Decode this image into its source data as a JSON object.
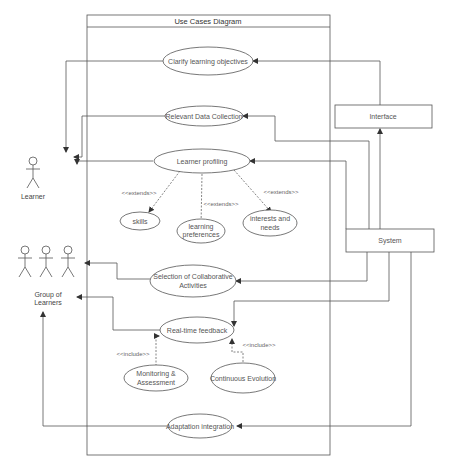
{
  "diagram": {
    "title": "Use Cases Diagram",
    "actors": {
      "learner": {
        "label": "Learner"
      },
      "group": {
        "label_line1": "Group of",
        "label_line2": "Learners"
      }
    },
    "external": {
      "interface": {
        "label": "Interface"
      },
      "system": {
        "label": "System"
      }
    },
    "use_cases": {
      "clarify": {
        "label": "Clarify learning objectives"
      },
      "data_collection": {
        "label": "Relevant Data Collection"
      },
      "profiling": {
        "label": "Learner profiling"
      },
      "skills": {
        "label": "skills"
      },
      "preferences": {
        "line1": "learning",
        "line2": "preferences"
      },
      "interests": {
        "line1": "interests and",
        "line2": "needs"
      },
      "collaborative": {
        "line1": "Selection of Collaborative",
        "line2": "Activities"
      },
      "feedback": {
        "label": "Real-time feedback"
      },
      "monitoring": {
        "line1": "Monitoring &",
        "line2": "Assessment"
      },
      "evolution": {
        "label": "Continuous Evolution"
      },
      "adaptation": {
        "label": "Adaptation integration"
      }
    },
    "stereotypes": {
      "extends_skills": "<<extends>>",
      "extends_preferences": "<<extends>>",
      "extends_interests": "<<extends>>",
      "include_monitoring": "<<include>>",
      "include_evolution": "<<include>>"
    },
    "colors": {
      "stroke": "#555555",
      "background": "#ffffff",
      "text": "#555555"
    }
  }
}
